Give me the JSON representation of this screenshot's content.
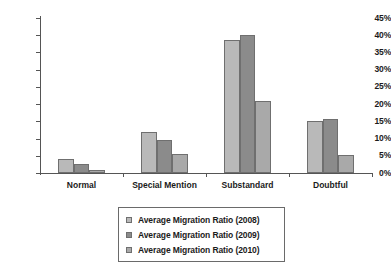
{
  "chart_data": {
    "type": "bar",
    "title": "",
    "subtitle": "",
    "xlabel": "",
    "ylabel": "",
    "categories": [
      "Normal",
      "Special Mention",
      "Substandard",
      "Doubtful"
    ],
    "series": [
      {
        "name": "Average Migration Ratio (2008)",
        "color": "#b9b9b9",
        "values": [
          4.2,
          12.0,
          38.5,
          15.2
        ]
      },
      {
        "name": "Average Migration Ratio (2009)",
        "color": "#8b8b8b",
        "values": [
          2.5,
          9.7,
          40.0,
          15.8
        ]
      },
      {
        "name": "Average Migration Ratio (2010)",
        "color": "#a9a9a9",
        "values": [
          0.9,
          5.5,
          21.0,
          5.3
        ]
      }
    ],
    "ylim": [
      0,
      45
    ],
    "ytick_step": 5,
    "ytick_labels": [
      "0%",
      "5%",
      "10%",
      "15%",
      "20%",
      "25%",
      "30%",
      "35%",
      "40%",
      "45%"
    ],
    "value_suffix": "%",
    "grid": false,
    "legend_position": "bottom"
  }
}
